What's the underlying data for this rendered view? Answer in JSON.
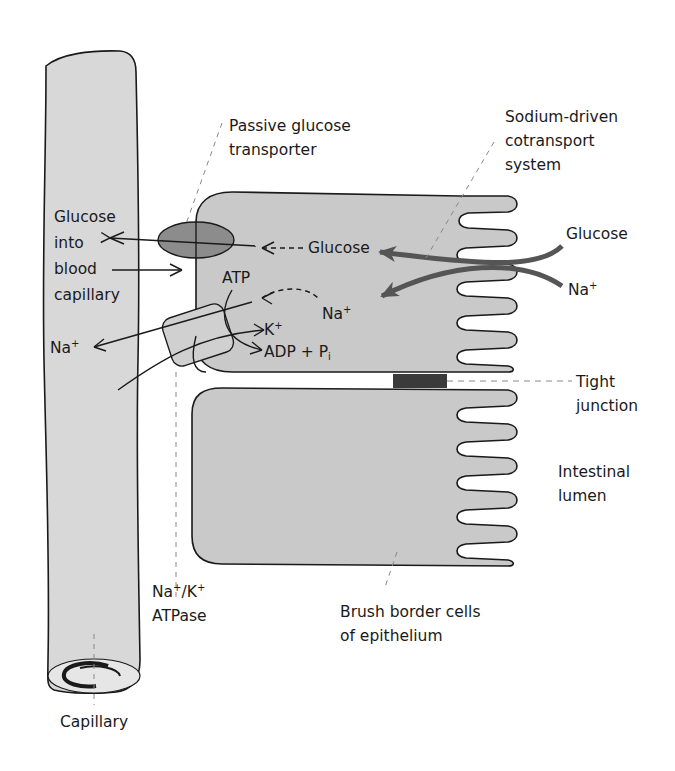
{
  "diagram": {
    "colors": {
      "cell_fill": "#c9c9c9",
      "capillary_fill": "#d8d8d8",
      "outline": "#1a1a1a",
      "transporter_fill": "#8c8c8c",
      "cotransport_arrow": "#555555",
      "tight_junction": "#3a3a3a",
      "leader_line": "#888888"
    },
    "labels": {
      "passive_transporter_1": "Passive glucose",
      "passive_transporter_2": "transporter",
      "sodium_cotransport_1": "Sodium-driven",
      "sodium_cotransport_2": "cotransport",
      "sodium_cotransport_3": "system",
      "glucose_into_1": "Glucose",
      "glucose_into_2": "into",
      "glucose_into_3": "blood",
      "glucose_into_4": "capillary",
      "glucose_inside": "Glucose",
      "glucose_lumen": "Glucose",
      "na_lumen": "Na",
      "na_inside": "Na",
      "na_blood": "Na",
      "plus": "+",
      "atp": "ATP",
      "k_ion": "K",
      "adp": "ADP + P",
      "adp_sub": "i",
      "tight_junction_1": "Tight",
      "tight_junction_2": "junction",
      "intestinal_lumen_1": "Intestinal",
      "intestinal_lumen_2": "lumen",
      "atpase_1a": "Na",
      "atpase_1b": "/K",
      "atpase_2": "ATPase",
      "brush_border_1": "Brush border cells",
      "brush_border_2": "of epithelium",
      "capillary": "Capillary"
    }
  }
}
